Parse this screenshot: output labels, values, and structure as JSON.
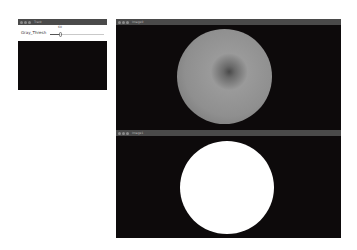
{
  "trackbar_window": {
    "title": "Track",
    "trackbar": {
      "label": "Gray_Thresh",
      "value": "60"
    }
  },
  "image_windows": [
    {
      "title": "Image0",
      "content": "grayscale-apple"
    },
    {
      "title": "Image1",
      "content": "binary-threshold-mask"
    }
  ],
  "colors": {
    "titlebar": "#4a4a4a",
    "background": "#0d0a0b",
    "mask": "#ffffff"
  }
}
